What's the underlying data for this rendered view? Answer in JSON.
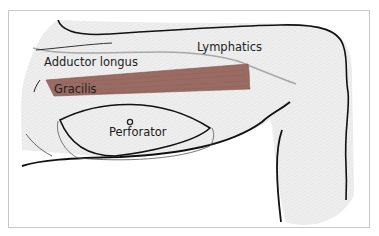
{
  "figure": {
    "type": "anatomical-illustration"
  },
  "labels": {
    "lymphatics": "Lymphatics",
    "adductor_longus": "Adductor longus",
    "gracilis": "Gracilis",
    "perforator": "Perforator"
  },
  "colors": {
    "skin_fill": "#ececec",
    "outline": "#111111",
    "muscle": "#9a6b62",
    "lymphatic_line": "#a8a8a8",
    "frame_border": "#c8c8c8"
  }
}
